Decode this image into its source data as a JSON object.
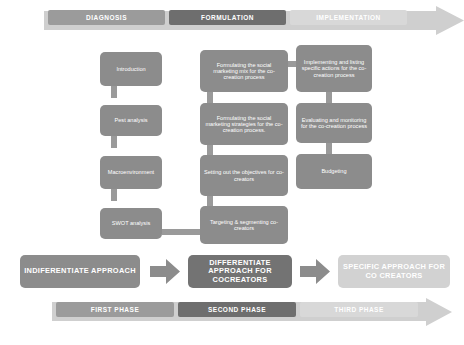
{
  "diagram": {
    "colors": {
      "box_dark": "#8c8c8c",
      "box_darker": "#737373",
      "box_light": "#d2d2d2",
      "banner_first": "#9b9b9b",
      "banner_second": "#6e6e6e",
      "banner_third": "#d8d8d8",
      "connector": "#9a9a9a",
      "arrow": "#8c8c8c",
      "background_arrow": "#cfcfcf",
      "text_on_box": "#ffffff"
    },
    "top_banner": {
      "name": "stage-banner",
      "segments": [
        {
          "label": "DIAGNOSIS",
          "tone": "a"
        },
        {
          "label": "FORMULATION",
          "tone": "b"
        },
        {
          "label": "IMPLEMENTATION",
          "tone": "c"
        }
      ]
    },
    "bottom_banner": {
      "name": "phase-banner",
      "segments": [
        {
          "label": "FIRST PHASE",
          "tone": "a"
        },
        {
          "label": "SECOND PHASE",
          "tone": "b"
        },
        {
          "label": "THIRD PHASE",
          "tone": "c"
        }
      ]
    },
    "columns": {
      "diagnosis": {
        "heading": "DIAGNOSIS",
        "steps": [
          {
            "label": "Introduction"
          },
          {
            "label": "Pest analysis"
          },
          {
            "label": "Macroenvironment"
          },
          {
            "label": "SWOT analysis"
          }
        ]
      },
      "formulation": {
        "heading": "FORMULATION",
        "steps": [
          {
            "label": "Formulating the social marketing mix for the co-creation process"
          },
          {
            "label": "Formulating the social marketing strategies for the co-creation process."
          },
          {
            "label": "Setting out the objectives for co-creators"
          },
          {
            "label": "Targeting & segmenting co-creators"
          }
        ]
      },
      "implementation": {
        "heading": "IMPLEMENTATION",
        "steps": [
          {
            "label": "Implementing and listing specific actions for the co-creation process"
          },
          {
            "label": "Evaluating and monitoring for the co-creation process"
          },
          {
            "label": "Budgeting"
          }
        ]
      }
    },
    "approach_row": {
      "name": "approach-progression",
      "items": [
        {
          "label": "INDIFERENTIATE APPROACH",
          "tone": "dark"
        },
        {
          "label": "DIFFERENTIATE APPROACH FOR COCREATORS",
          "tone": "darker"
        },
        {
          "label": "SPECIFIC APPROACH FOR CO CREATORS",
          "tone": "light"
        }
      ],
      "arrows": 2
    }
  }
}
